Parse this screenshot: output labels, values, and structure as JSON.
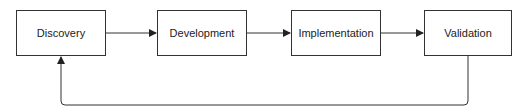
{
  "diagram": {
    "type": "flowchart",
    "nodes": [
      {
        "id": "discovery",
        "label": "Discovery"
      },
      {
        "id": "development",
        "label": "Development"
      },
      {
        "id": "implementation",
        "label": "Implementation"
      },
      {
        "id": "validation",
        "label": "Validation"
      }
    ],
    "edges": [
      {
        "from": "discovery",
        "to": "development"
      },
      {
        "from": "development",
        "to": "implementation"
      },
      {
        "from": "implementation",
        "to": "validation"
      },
      {
        "from": "validation",
        "to": "discovery",
        "style": "feedback-loop"
      }
    ],
    "colors": {
      "stroke": "#333333",
      "text": "#222222",
      "background": "#ffffff"
    }
  }
}
